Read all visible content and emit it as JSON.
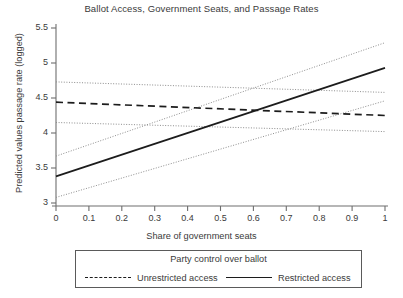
{
  "chart_data": {
    "type": "line",
    "title": "Ballot Access, Government Seats, and Passage Rates",
    "xlabel": "Share of government seats",
    "ylabel": "Predicted values passage rate (logged)",
    "xlim": [
      0,
      1
    ],
    "ylim": [
      2.85,
      5.6
    ],
    "xticks": [
      0,
      0.1,
      0.2,
      0.3,
      0.4,
      0.5,
      0.6,
      0.7,
      0.8,
      0.9,
      1
    ],
    "xtick_labels": [
      "0",
      "0.1",
      "0.2",
      "0.3",
      "0.4",
      "0.5",
      "0.6",
      "0.7",
      "0.8",
      "0.9",
      "1"
    ],
    "yticks": [
      3,
      3.5,
      4,
      4.5,
      5,
      5.5
    ],
    "ytick_labels": [
      "3",
      "3.5",
      "4",
      "4.5",
      "5",
      "5.5"
    ],
    "grid": false,
    "legend_position": "below-axes",
    "legend_title": "Party control over ballot",
    "x": [
      0,
      1
    ],
    "series": [
      {
        "name": "Unrestricted access",
        "style": "dashed",
        "color": "#1c1c1c",
        "values": [
          4.44,
          4.25
        ],
        "ci_upper": [
          4.73,
          4.58
        ],
        "ci_lower": [
          4.15,
          4.02
        ]
      },
      {
        "name": "Restricted access",
        "style": "solid",
        "color": "#1c1c1c",
        "values": [
          3.38,
          4.93
        ],
        "ci_upper": [
          3.67,
          5.29
        ],
        "ci_lower": [
          3.08,
          4.46
        ]
      }
    ]
  },
  "legend": {
    "title": "Party control over ballot",
    "entries": [
      {
        "label": "Unrestricted access",
        "style": "dashed"
      },
      {
        "label": "Restricted access",
        "style": "solid"
      }
    ]
  },
  "axes": {
    "y_axis_label": "Predicted values passage rate (logged)",
    "x_axis_label": "Share of government seats"
  }
}
